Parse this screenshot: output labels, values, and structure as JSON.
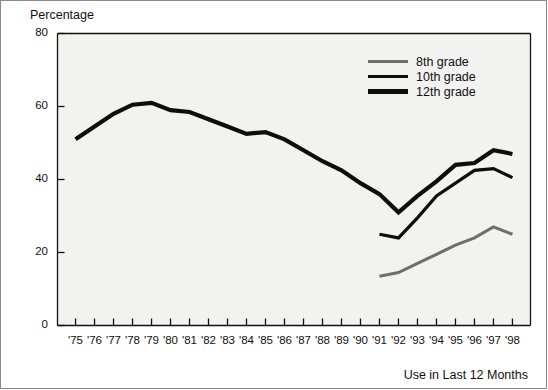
{
  "chart_data": {
    "type": "line",
    "title": "",
    "xlabel": "Use in Last 12 Months",
    "ylabel": "Percentage",
    "ylim": [
      0,
      80
    ],
    "yticks": [
      0,
      20,
      40,
      60,
      80
    ],
    "grid": false,
    "legend_position": "top-right",
    "x": [
      "'75",
      "'76",
      "'77",
      "'78",
      "'79",
      "'80",
      "'81",
      "'82",
      "'83",
      "'84",
      "'85",
      "'86",
      "'87",
      "'88",
      "'89",
      "'90",
      "'91",
      "'92",
      "'93",
      "'94",
      "'95",
      "'96",
      "'97",
      "'98"
    ],
    "categories": [
      "'75",
      "'76",
      "'77",
      "'78",
      "'79",
      "'80",
      "'81",
      "'82",
      "'83",
      "'84",
      "'85",
      "'86",
      "'87",
      "'88",
      "'89",
      "'90",
      "'91",
      "'92",
      "'93",
      "'94",
      "'95",
      "'96",
      "'97",
      "'98"
    ],
    "series": [
      {
        "name": "8th grade",
        "color": "#6e6e6e",
        "width": 3.0,
        "values": [
          null,
          null,
          null,
          null,
          null,
          null,
          null,
          null,
          null,
          null,
          null,
          null,
          null,
          null,
          null,
          null,
          13.5,
          14.5,
          17.0,
          19.5,
          22.0,
          24.0,
          27.0,
          25.0
        ]
      },
      {
        "name": "10th grade",
        "color": "#0d0d0d",
        "width": 3.2,
        "values": [
          null,
          null,
          null,
          null,
          null,
          null,
          null,
          null,
          null,
          null,
          null,
          null,
          null,
          null,
          null,
          null,
          25.0,
          24.0,
          29.5,
          35.5,
          39.0,
          42.5,
          43.0,
          40.5
        ]
      },
      {
        "name": "12th grade",
        "color": "#0d0d0d",
        "width": 4.2,
        "values": [
          51.0,
          54.5,
          58.0,
          60.5,
          61.0,
          59.0,
          58.5,
          56.5,
          54.5,
          52.5,
          53.0,
          51.0,
          48.0,
          45.0,
          42.5,
          39.0,
          36.0,
          31.0,
          35.5,
          39.5,
          44.0,
          44.5,
          48.0,
          47.0
        ]
      }
    ],
    "legend": [
      {
        "label": "8th grade",
        "color": "#6e6e6e",
        "width": 3.0
      },
      {
        "label": "10th grade",
        "color": "#0d0d0d",
        "width": 3.4
      },
      {
        "label": "12th grade",
        "color": "#0d0d0d",
        "width": 4.6
      }
    ]
  }
}
